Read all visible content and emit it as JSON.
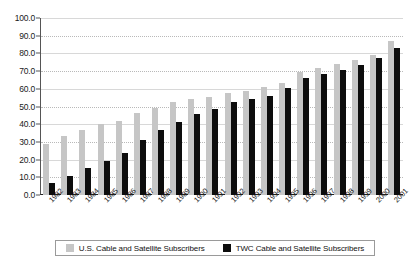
{
  "chart_data": {
    "type": "bar",
    "title": "",
    "subtitle": "",
    "xlabel": "",
    "ylabel": "",
    "ylim": [
      0,
      100
    ],
    "yticks": [
      "0.0",
      "10.0",
      "20.0",
      "30.0",
      "40.0",
      "50.0",
      "60.0",
      "70.0",
      "80.0",
      "90.0",
      "100.0"
    ],
    "ytick_values": [
      0,
      10,
      20,
      30,
      40,
      50,
      60,
      70,
      80,
      90,
      100
    ],
    "grid": true,
    "legend_position": "bottom",
    "categories": [
      "1982",
      "1983",
      "1984",
      "1985",
      "1986",
      "1987",
      "1988",
      "1989",
      "1990",
      "1991",
      "1992",
      "1993",
      "1994",
      "1995",
      "1996",
      "1997",
      "1998",
      "1999",
      "2000",
      "2001"
    ],
    "series": [
      {
        "name": "U.S. Cable and Satellite Subscribers",
        "color": "#c6c6c6",
        "values": [
          29.0,
          33.5,
          37.0,
          40.0,
          42.0,
          46.5,
          49.0,
          52.5,
          54.0,
          55.5,
          57.5,
          59.0,
          61.0,
          63.5,
          69.5,
          71.5,
          74.0,
          76.5,
          79.0,
          87.0
        ]
      },
      {
        "name": "TWC Cable and Satellite Subscribers",
        "color": "#0d0d0d",
        "values": [
          7.0,
          11.0,
          15.5,
          19.5,
          23.5,
          31.0,
          36.5,
          41.0,
          45.5,
          48.5,
          52.5,
          54.5,
          56.0,
          60.5,
          66.0,
          68.5,
          70.5,
          73.5,
          77.5,
          83.0
        ]
      }
    ]
  },
  "legend": {
    "items": [
      {
        "label": "U.S. Cable and Satellite Subscribers",
        "color": "#c6c6c6"
      },
      {
        "label": "TWC Cable and Satellite Subscribers",
        "color": "#0d0d0d"
      }
    ]
  }
}
